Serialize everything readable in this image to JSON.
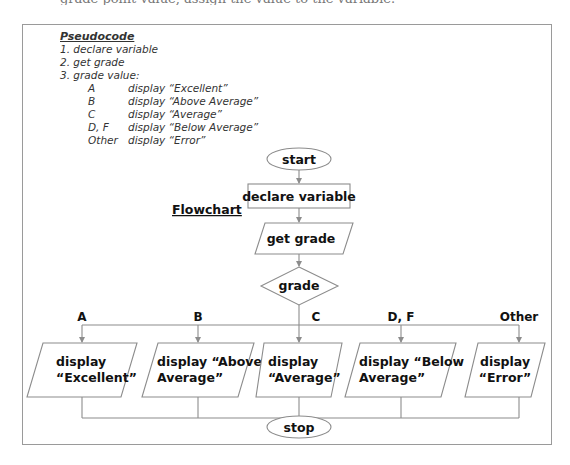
{
  "header": {
    "partial_text_above": "grade point value, assign the value to the variable."
  },
  "pseudocode": {
    "title": "Pseudocode",
    "steps": [
      "1.  declare variable",
      "2. get grade",
      "3. grade value:"
    ],
    "cases": [
      {
        "key": "A",
        "action": "display “Excellent”"
      },
      {
        "key": "B",
        "action": "display “Above Average”"
      },
      {
        "key": "C",
        "action": "display “Average”"
      },
      {
        "key": "D, F",
        "action": "display “Below Average”"
      },
      {
        "key": "Other",
        "action": "display “Error”"
      }
    ]
  },
  "flowchart": {
    "heading": "Flowchart",
    "start": "start",
    "declare": "declare variable",
    "input": "get grade",
    "decision": "grade",
    "branches": [
      {
        "label": "A",
        "line1": "display",
        "line2": "“Excellent”"
      },
      {
        "label": "B",
        "line1": "display “Above",
        "line2": "Average”"
      },
      {
        "label": "C",
        "line1": "display",
        "line2": "“Average”"
      },
      {
        "label": "D, F",
        "line1": "display “Below",
        "line2": "Average”"
      },
      {
        "label": "Other",
        "line1": "display",
        "line2": "“Error”"
      }
    ],
    "stop": "stop"
  },
  "colors": {
    "stroke": "#8c8c8c",
    "frame": "#9a9a9a",
    "text": "#111111"
  }
}
